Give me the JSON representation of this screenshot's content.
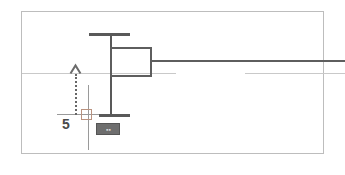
{
  "canvas": {
    "width": 345,
    "height": 175,
    "background_color": "#ffffff",
    "frame_border_color": "#bdbdbd"
  },
  "drawing": {
    "title": "cad-dimension-view",
    "colors": {
      "structure": "#595959",
      "outline": "#5e5e5e",
      "guide": "#c9c9c9",
      "guide_strong": "#9a9a9a",
      "dimension": "#666666",
      "handle": "#b9927f",
      "badge_fill": "#6e6e6e",
      "badge_text": "#dcdcdc",
      "value_text": "#4a4a4a"
    },
    "elements": {
      "top_bar": "horizontal-bar-top",
      "bottom_bar": "horizontal-bar-bottom",
      "stem": "vertical-stem",
      "box": "rectangle-outline",
      "lead_line": "lead-line-right",
      "guide_left": "guide-line-left",
      "guide_right": "guide-line-right",
      "guide_base": "guide-line-base",
      "dimension_line": "dotted-dimension-line",
      "arrow_head": "up-arrow-head",
      "crosshair": "crosshair-vertical",
      "grip": "grip-handle"
    }
  },
  "measurement": {
    "value": "5",
    "label_name": "dimension-value"
  },
  "badge": {
    "text": "▪▪",
    "name": "dimension-badge"
  }
}
